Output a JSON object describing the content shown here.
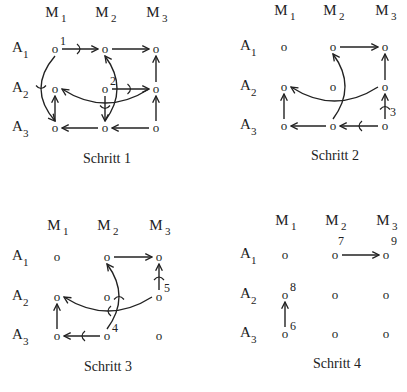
{
  "panels": [
    {
      "id": "schritt-1",
      "caption": "Schritt 1",
      "origin": [
        0,
        0
      ],
      "cols": [
        55,
        105,
        156
      ],
      "rows": [
        49,
        89,
        128
      ],
      "header_y": 17,
      "label_x": 12,
      "caption_pos": [
        107,
        163
      ],
      "col_labels": [
        "M",
        "M",
        "M"
      ],
      "col_subs": [
        "1",
        "2",
        "3"
      ],
      "row_labels": [
        "A",
        "A",
        "A"
      ],
      "row_subs": [
        "1",
        "2",
        "3"
      ],
      "node_glyph": "o",
      "numbers": [
        {
          "text": "1",
          "r": 0,
          "c": 0
        },
        {
          "text": "2",
          "r": 1,
          "c": 1
        }
      ],
      "edges": [
        {
          "from": [
            0,
            0
          ],
          "to": [
            0,
            1
          ],
          "type": "straight",
          "tick": true
        },
        {
          "from": [
            0,
            1
          ],
          "to": [
            0,
            2
          ],
          "type": "straight"
        },
        {
          "from": [
            1,
            2
          ],
          "to": [
            0,
            2
          ],
          "type": "straight"
        },
        {
          "from": [
            1,
            1
          ],
          "to": [
            1,
            2
          ],
          "type": "straight",
          "tick": true
        },
        {
          "from": [
            1,
            2
          ],
          "to": [
            1,
            0
          ],
          "type": "curve",
          "bend": -14
        },
        {
          "from": [
            0,
            0
          ],
          "to": [
            2,
            0
          ],
          "type": "curve",
          "bend": 14,
          "tick": true
        },
        {
          "from": [
            2,
            0
          ],
          "to": [
            1,
            0
          ],
          "type": "straight"
        },
        {
          "from": [
            1,
            1
          ],
          "to": [
            2,
            1
          ],
          "type": "straight",
          "tick": true
        },
        {
          "from": [
            2,
            1
          ],
          "to": [
            0,
            1
          ],
          "type": "curve",
          "bend": 12
        },
        {
          "from": [
            2,
            1
          ],
          "to": [
            2,
            0
          ],
          "type": "straight"
        },
        {
          "from": [
            2,
            2
          ],
          "to": [
            2,
            1
          ],
          "type": "straight"
        },
        {
          "from": [
            2,
            2
          ],
          "to": [
            1,
            2
          ],
          "type": "straight"
        }
      ]
    },
    {
      "id": "schritt-2",
      "caption": "Schritt 2",
      "origin": [
        0,
        0
      ],
      "cols": [
        284,
        333,
        385
      ],
      "rows": [
        47,
        87,
        126
      ],
      "header_y": 15,
      "label_x": 240,
      "caption_pos": [
        335,
        160
      ],
      "col_labels": [
        "M",
        "M",
        "M"
      ],
      "col_subs": [
        "1",
        "2",
        "3"
      ],
      "row_labels": [
        "A",
        "A",
        "A"
      ],
      "row_subs": [
        "1",
        "2",
        "3"
      ],
      "node_glyph": "o",
      "numbers": [
        {
          "text": "3",
          "r": 2,
          "c": 2,
          "dx": 5,
          "dy": -10
        }
      ],
      "edges": [
        {
          "from": [
            0,
            1
          ],
          "to": [
            0,
            2
          ],
          "type": "straight"
        },
        {
          "from": [
            1,
            2
          ],
          "to": [
            0,
            2
          ],
          "type": "straight"
        },
        {
          "from": [
            2,
            2
          ],
          "to": [
            1,
            2
          ],
          "type": "straight",
          "tick": true
        },
        {
          "from": [
            1,
            2
          ],
          "to": [
            1,
            0
          ],
          "type": "curve",
          "bend": -14
        },
        {
          "from": [
            2,
            1
          ],
          "to": [
            0,
            1
          ],
          "type": "curve",
          "bend": 12
        },
        {
          "from": [
            2,
            2
          ],
          "to": [
            2,
            1
          ],
          "type": "straight",
          "tick": true
        },
        {
          "from": [
            2,
            1
          ],
          "to": [
            2,
            0
          ],
          "type": "straight"
        },
        {
          "from": [
            2,
            0
          ],
          "to": [
            1,
            0
          ],
          "type": "straight"
        }
      ]
    },
    {
      "id": "schritt-3",
      "caption": "Schritt 3",
      "origin": [
        0,
        0
      ],
      "cols": [
        57,
        107,
        159
      ],
      "rows": [
        257,
        297,
        336
      ],
      "header_y": 230,
      "label_x": 12,
      "caption_pos": [
        108,
        371
      ],
      "col_labels": [
        "M",
        "M",
        "M"
      ],
      "col_subs": [
        "1",
        "2",
        "3"
      ],
      "row_labels": [
        "A",
        "A",
        "A"
      ],
      "row_subs": [
        "1",
        "2",
        "3"
      ],
      "node_glyph": "o",
      "numbers": [
        {
          "text": "4",
          "r": 2,
          "c": 1
        },
        {
          "text": "5",
          "r": 1,
          "c": 2,
          "dx": 5,
          "dy": -5
        }
      ],
      "edges": [
        {
          "from": [
            0,
            1
          ],
          "to": [
            0,
            2
          ],
          "type": "straight"
        },
        {
          "from": [
            1,
            2
          ],
          "to": [
            0,
            2
          ],
          "type": "straight",
          "tick": true
        },
        {
          "from": [
            1,
            2
          ],
          "to": [
            1,
            0
          ],
          "type": "curve",
          "bend": -14,
          "tick": true
        },
        {
          "from": [
            2,
            1
          ],
          "to": [
            0,
            1
          ],
          "type": "curve",
          "bend": 12,
          "tick": true
        },
        {
          "from": [
            2,
            1
          ],
          "to": [
            2,
            0
          ],
          "type": "straight",
          "tick": true
        },
        {
          "from": [
            2,
            0
          ],
          "to": [
            1,
            0
          ],
          "type": "straight"
        }
      ]
    },
    {
      "id": "schritt-4",
      "caption": "Schritt 4",
      "origin": [
        0,
        0
      ],
      "cols": [
        285,
        335,
        386
      ],
      "rows": [
        255,
        295,
        334
      ],
      "header_y": 225,
      "label_x": 240,
      "caption_pos": [
        337,
        368
      ],
      "col_labels": [
        "M",
        "M",
        "M"
      ],
      "col_subs": [
        "1",
        "2",
        "3"
      ],
      "row_labels": [
        "A",
        "A",
        "A"
      ],
      "row_subs": [
        "1",
        "2",
        "3"
      ],
      "node_glyph": "o",
      "numbers": [
        {
          "text": "7",
          "r": 0,
          "c": 1,
          "dx": 3,
          "dy": -10
        },
        {
          "text": "9",
          "r": 0,
          "c": 2,
          "dx": 5,
          "dy": -10
        },
        {
          "text": "8",
          "r": 1,
          "c": 0
        },
        {
          "text": "6",
          "r": 2,
          "c": 0
        }
      ],
      "edges": [
        {
          "from": [
            0,
            1
          ],
          "to": [
            0,
            2
          ],
          "type": "straight"
        },
        {
          "from": [
            2,
            0
          ],
          "to": [
            1,
            0
          ],
          "type": "straight"
        }
      ]
    }
  ]
}
